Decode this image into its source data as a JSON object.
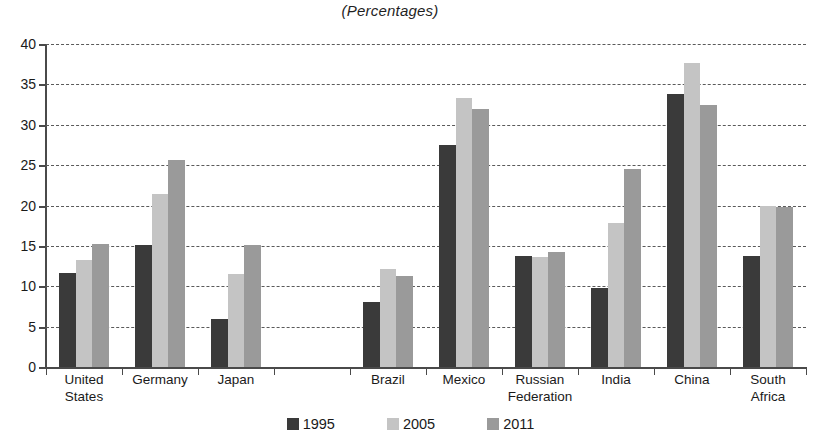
{
  "chart_data": {
    "type": "bar",
    "title": "(Percentages)",
    "subtitle": "",
    "xlabel": "",
    "ylabel": "",
    "ylim": [
      0,
      40
    ],
    "ytick_step": 5,
    "yticks": [
      "40",
      "35",
      "30",
      "25",
      "20",
      "15",
      "10",
      "5",
      "0"
    ],
    "grid": true,
    "legend_position": "bottom",
    "categories": [
      "United\nStates",
      "Germany",
      "Japan",
      "",
      "Brazil",
      "Mexico",
      "Russian\nFederation",
      "India",
      "China",
      "South\nAfrica"
    ],
    "series": [
      {
        "name": "1995",
        "color": "#3a3a3a",
        "values": [
          11.6,
          15.1,
          5.9,
          null,
          8.1,
          27.5,
          13.7,
          9.8,
          33.8,
          13.8
        ]
      },
      {
        "name": "2005",
        "color": "#c4c4c4",
        "values": [
          13.2,
          21.4,
          11.5,
          null,
          12.1,
          33.3,
          13.6,
          17.8,
          37.7,
          19.9
        ]
      },
      {
        "name": "2011",
        "color": "#9a9a9a",
        "values": [
          15.2,
          25.6,
          15.1,
          null,
          11.3,
          31.9,
          14.2,
          24.5,
          32.5,
          19.8
        ]
      }
    ]
  },
  "legend": {
    "items": [
      {
        "label": "1995",
        "color": "#3a3a3a"
      },
      {
        "label": "2005",
        "color": "#c4c4c4"
      },
      {
        "label": "2011",
        "color": "#9a9a9a"
      }
    ]
  },
  "colors": {
    "series_1995": "#3a3a3a",
    "series_2005": "#c4c4c4",
    "series_2011": "#9a9a9a",
    "axis": "#4a4a4a",
    "gridline": "#5a5a5a",
    "background": "#ffffff",
    "text": "#1a1a1a"
  }
}
